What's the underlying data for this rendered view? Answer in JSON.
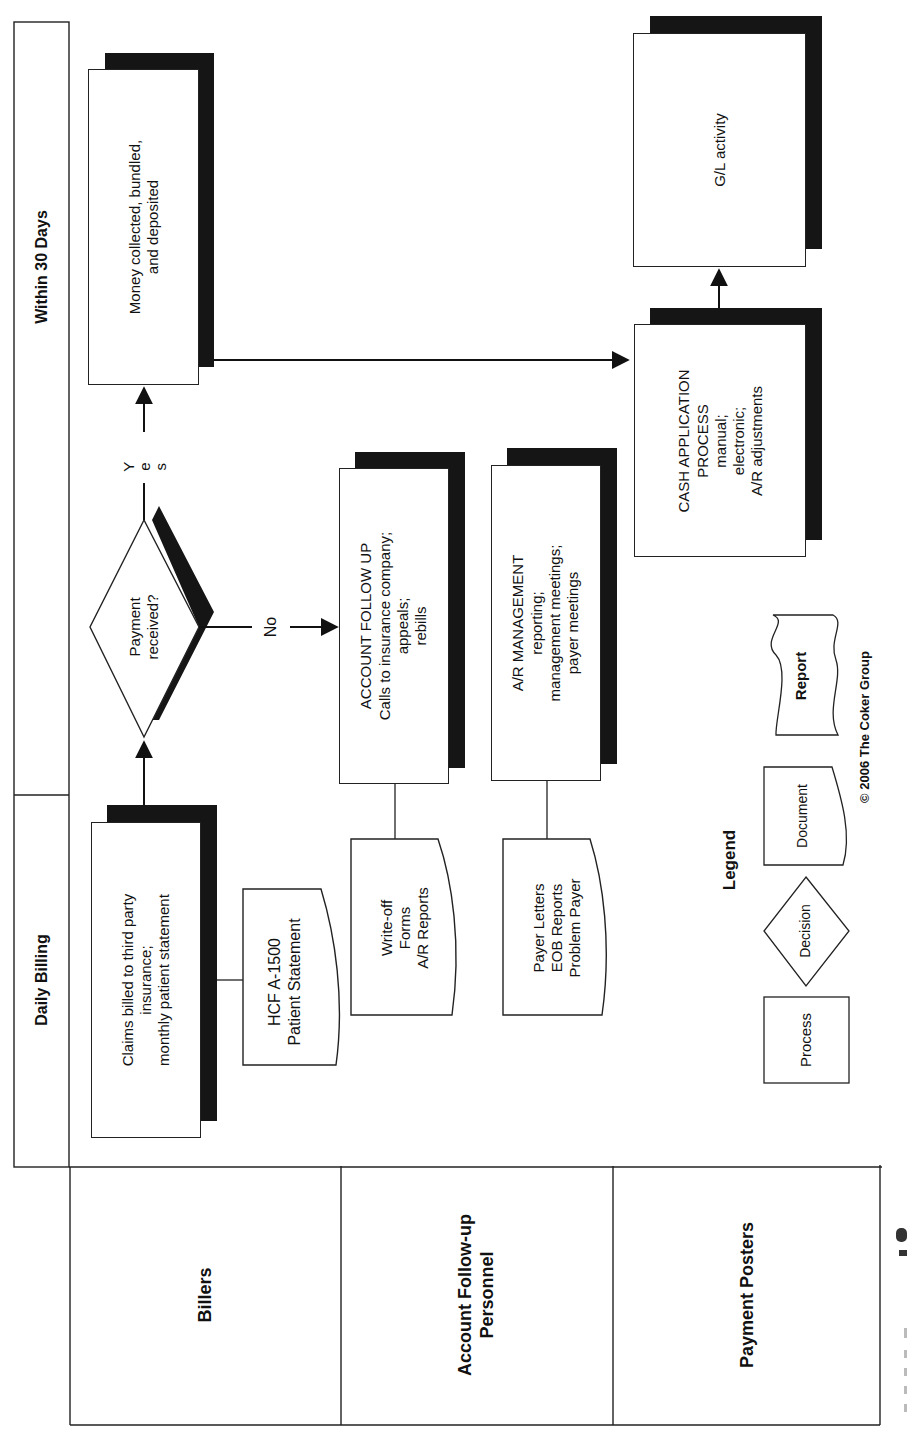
{
  "diagram": {
    "phases": [
      {
        "id": "daily",
        "label": "Daily Billing"
      },
      {
        "id": "thirty",
        "label": "Within 30 Days"
      }
    ],
    "lanes": [
      {
        "id": "billers",
        "label": "Billers"
      },
      {
        "id": "followup",
        "label": "Account Follow-up\nPersonnel"
      },
      {
        "id": "posters",
        "label": "Payment Posters"
      }
    ],
    "nodes": {
      "claims": {
        "type": "process",
        "text": "Claims billed to third party\ninsurance;\nmonthly patient statement"
      },
      "hcfa": {
        "type": "document",
        "text": "HCF A-1500\nPatient Statement"
      },
      "decision": {
        "type": "decision",
        "text": "Payment\nreceived?"
      },
      "money": {
        "type": "process",
        "text": "Money collected, bundled,\nand deposited"
      },
      "followup": {
        "type": "process",
        "text": "ACCOUNT FOLLOW UP\nCalls to insurance company;\nappeals;\nrebills"
      },
      "writeoff": {
        "type": "document",
        "text": "Write-off\nForms\nA/R Reports"
      },
      "armgmt": {
        "type": "process",
        "text": "A/R MANAGEMENT\nreporting;\nmanagement meetings;\npayer meetings"
      },
      "payer": {
        "type": "document",
        "text": "Payer Letters\nEOB Reports\nProblem Payer"
      },
      "cashapp": {
        "type": "process",
        "text": "CASH APPLICATION\nPROCESS\nmanual;\nelectronic;\nA/R adjustments"
      },
      "gl": {
        "type": "process",
        "text": "G/L activity"
      }
    },
    "edges": [
      {
        "from": "claims",
        "to": "decision",
        "label": ""
      },
      {
        "from": "decision",
        "to": "money",
        "label": "Yes"
      },
      {
        "from": "decision",
        "to": "followup",
        "label": "No"
      },
      {
        "from": "money",
        "to": "cashapp",
        "label": ""
      },
      {
        "from": "cashapp",
        "to": "gl",
        "label": ""
      }
    ],
    "edge_labels": {
      "yes": "Y\ne\ns",
      "no": "No"
    },
    "legend": {
      "title": "Legend",
      "items": [
        {
          "shape": "process",
          "label": "Process"
        },
        {
          "shape": "decision",
          "label": "Decision"
        },
        {
          "shape": "document",
          "label": "Document"
        },
        {
          "shape": "report",
          "label": "Report"
        }
      ]
    },
    "copyright": "© 2006 The Coker Group",
    "colors": {
      "line": "#222222",
      "shadow": "#151515",
      "background": "#ffffff"
    }
  }
}
